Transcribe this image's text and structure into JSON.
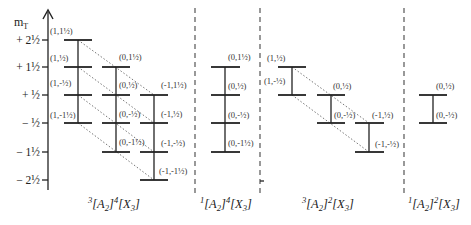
{
  "axis": {
    "label": "m",
    "label_sub": "T",
    "ticks": [
      "+ 2½",
      "+ 1½",
      "+  ½",
      "−  ½",
      "− 1½",
      "− 2½"
    ]
  },
  "panels": [
    {
      "caption": {
        "sup1": "3",
        "a": "[A",
        "asub": "2",
        "b": "]",
        "sup2": "4",
        "c": "[X",
        "csub": "3",
        "d": "]"
      },
      "states": [
        "(1,1½)",
        "(1,½)",
        "(1,-½)",
        "(1,-1½)",
        "(0,1½)",
        "(0,½)",
        "(0,-½)",
        "(0,-1½)",
        "(-1,1½)",
        "(-1,½)",
        "(-1,-½)",
        "(-1,-1½)"
      ]
    },
    {
      "caption": {
        "sup1": "1",
        "a": "[A",
        "asub": "2",
        "b": "]",
        "sup2": "4",
        "c": "[X",
        "csub": "3",
        "d": "]"
      },
      "states": [
        "(0,1½)",
        "(0,½)",
        "(0,-½)",
        "(0,-1½)"
      ]
    },
    {
      "caption": {
        "sup1": "3",
        "a": "[A",
        "asub": "2",
        "b": "]",
        "sup2": "2",
        "c": "[X",
        "csub": "3",
        "d": "]"
      },
      "states": [
        "(1,½)",
        "(1,-½)",
        "(0,½)",
        "(0,-½)",
        "(-1,½)",
        "(-1,-½)"
      ]
    },
    {
      "caption": {
        "sup1": "1",
        "a": "[A",
        "asub": "2",
        "b": "]",
        "sup2": "2",
        "c": "[X",
        "csub": "3",
        "d": "]"
      },
      "states": [
        "(0,½)",
        "(0,-½)"
      ]
    }
  ]
}
